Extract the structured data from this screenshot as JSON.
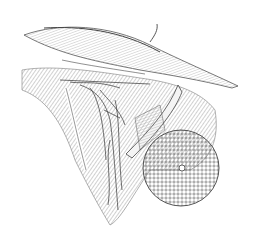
{
  "image": {
    "subject": "anatomical engraving of axillary region with lymphatic vessels, muscles and breast",
    "background": "#ffffff",
    "ink": "#3a3a3a",
    "elements": [
      "clavicle-region",
      "pectoral-muscles",
      "axillary-lymphatics",
      "retracted-muscle-band",
      "breast-with-areola"
    ]
  }
}
